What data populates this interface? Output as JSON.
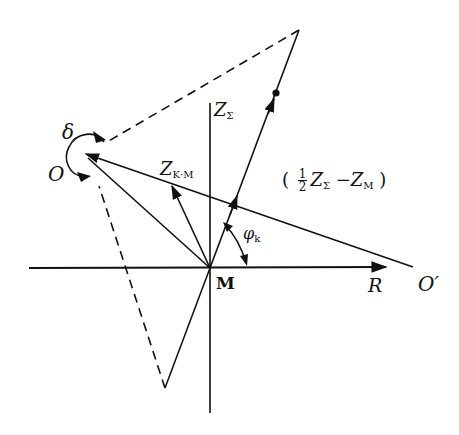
{
  "diagram": {
    "labels": {
      "delta": "δ",
      "O": "O",
      "O_prime": "O′",
      "M": "M",
      "R": "R",
      "Z_sigma_main": "Z",
      "Z_sigma_sub": "Σ",
      "Z_km_main": "Z",
      "Z_km_sub": "K·M",
      "phi_main": "φ",
      "phi_sub": "k",
      "expr_open": "(",
      "expr_num": "1",
      "expr_den": "2",
      "expr_z1": "Z",
      "expr_z1_sub": "Σ",
      "expr_minus": "−",
      "expr_z2": "Z",
      "expr_z2_sub": "M",
      "expr_close": ")"
    },
    "colors": {
      "ink": "#111111",
      "background": "#ffffff"
    }
  }
}
